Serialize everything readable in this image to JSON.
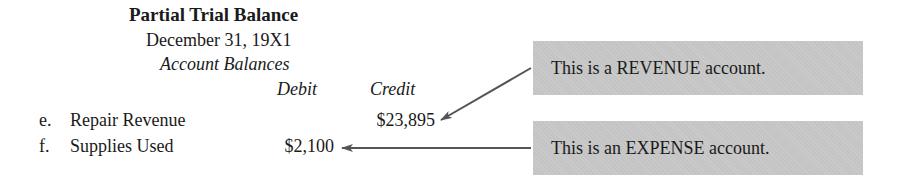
{
  "header": {
    "title": "Partial Trial Balance",
    "date": "December 31, 19X1",
    "subheading": "Account Balances"
  },
  "columns": {
    "debit": "Debit",
    "credit": "Credit"
  },
  "rows": [
    {
      "letter": "e.",
      "account": "Repair Revenue",
      "debit": "",
      "credit": "$23,895"
    },
    {
      "letter": "f.",
      "account": "Supplies Used",
      "debit": "$2,100",
      "credit": ""
    }
  ],
  "callouts": [
    {
      "text": "This is a REVENUE account.",
      "points_to": "Repair Revenue credit"
    },
    {
      "text": "This is an EXPENSE account.",
      "points_to": "Supplies Used debit"
    }
  ],
  "colors": {
    "callout_background": "#c4c4c4",
    "arrow": "#555555",
    "text": "#1a1a1a"
  }
}
